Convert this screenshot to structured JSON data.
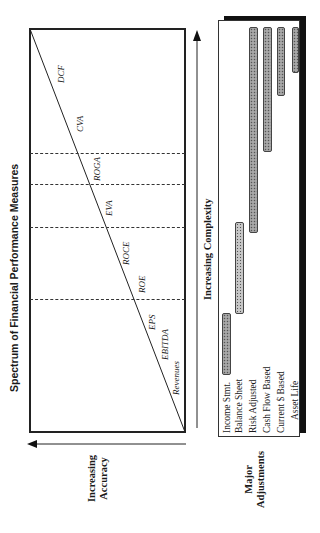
{
  "title": "Spectrum of Financial Performance Measures",
  "accuracy_axis": {
    "line1": "Increasing",
    "line2": "Accuracy"
  },
  "complexity_axis": {
    "label": "Increasing Complexity"
  },
  "adjustments_axis": {
    "line1": "Major",
    "line2": "Adjustments"
  },
  "measures": [
    {
      "label": "DCF"
    },
    {
      "label": "CVA"
    },
    {
      "label": "ROGA"
    },
    {
      "label": "EVA"
    },
    {
      "label": "ROCE"
    },
    {
      "label": "ROE"
    },
    {
      "label": "EPS"
    },
    {
      "label": "EBITDA"
    },
    {
      "label": "Revenues"
    }
  ],
  "adjustments": [
    {
      "label": "Income Stmt."
    },
    {
      "label": "Balance Sheet"
    },
    {
      "label": "Risk Adjusted"
    },
    {
      "label": "Cash Flow Based"
    },
    {
      "label": "Current $ Based"
    },
    {
      "label": "Asset Life"
    }
  ],
  "colors": {
    "line": "#222222",
    "bar": "#9a9a9a",
    "shadow": "#111111"
  }
}
